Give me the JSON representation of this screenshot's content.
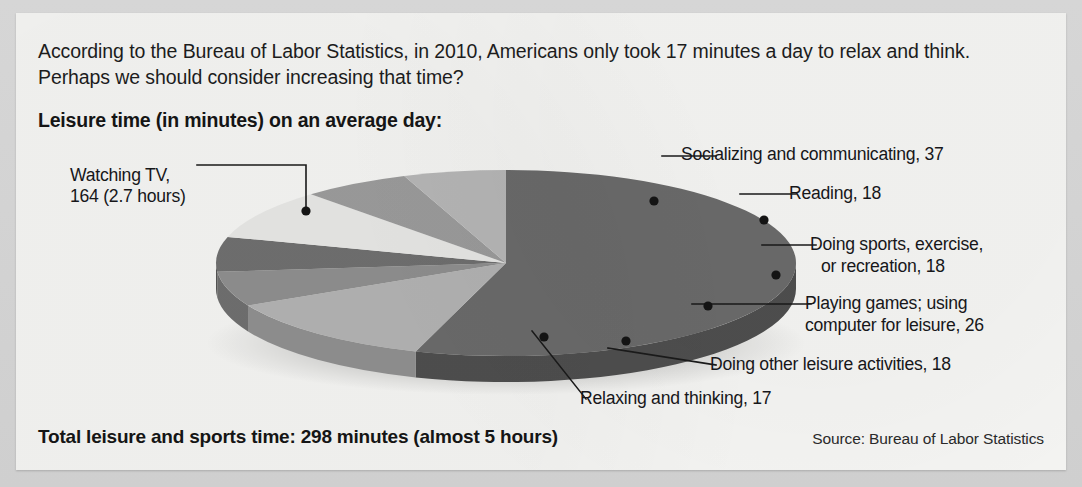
{
  "intro": {
    "text": "According to the Bureau of Labor Statistics, in 2010, Americans only took 17 minutes a day to relax and think. Perhaps we should consider increasing that time?"
  },
  "subtitle": "Leisure time (in minutes) on an average day:",
  "total": "Total leisure and sports time: 298 minutes (almost 5 hours)",
  "source": "Source: Bureau of Labor Statistics",
  "labels": {
    "watching_tv_l1": "Watching TV,",
    "watching_tv_l2": "164 (2.7 hours)",
    "socializing": "Socializing and communicating, 37",
    "reading": "Reading, 18",
    "sports_l1": "Doing sports, exercise,",
    "sports_l2": "or recreation, 18",
    "games_l1": "Playing games; using",
    "games_l2": "computer for leisure, 26",
    "other": "Doing other leisure activities, 18",
    "relaxing": "Relaxing and thinking, 17"
  },
  "chart_data": {
    "type": "pie",
    "title": "Leisure time (in minutes) on an average day:",
    "unit": "minutes",
    "total": 298,
    "total_label": "Total leisure and sports time: 298 minutes (almost 5 hours)",
    "source": "Source: Bureau of Labor Statistics",
    "three_d": true,
    "legend": "callout-labels",
    "categories": [
      "Watching TV",
      "Socializing and communicating",
      "Reading",
      "Doing sports, exercise, or recreation",
      "Playing games; using computer for leisure",
      "Doing other leisure activities",
      "Relaxing and thinking"
    ],
    "values": [
      164,
      37,
      18,
      18,
      26,
      18,
      17
    ],
    "value_labels": [
      "164 (2.7 hours)",
      "37",
      "18",
      "18",
      "26",
      "18",
      "17"
    ],
    "colors": [
      "#6a6a6a",
      "#b2b2b2",
      "#8e8e8e",
      "#6f6f6f",
      "#e6e6e4",
      "#9b9b9b",
      "#b6b6b6"
    ],
    "side_colors": [
      "#4e4e4e",
      "#8f8f8f",
      "#6f6f6f",
      "#535353",
      "#bdbdbd",
      "#7a7a7a",
      "#909090"
    ]
  }
}
